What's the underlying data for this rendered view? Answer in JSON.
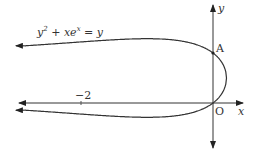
{
  "chart_data": {
    "type": "line",
    "title": "",
    "equation": "y^2 + x e^x = y",
    "xlabel": "x",
    "ylabel": "y",
    "tick_labels": [
      "-2"
    ],
    "points": [
      {
        "label": "A",
        "x": 0,
        "y": 1
      },
      {
        "label": "O",
        "x": 0,
        "y": 0
      }
    ],
    "asymptotes": [
      {
        "y": 1
      },
      {
        "y": 0
      }
    ],
    "series": [
      {
        "name": "upper branch",
        "x": [
          -3.2,
          -3,
          -2,
          -1,
          -0.5,
          0,
          0.1,
          0.204
        ],
        "y": [
          1.15,
          1.14,
          1.23,
          1.29,
          1.25,
          1.0,
          0.8,
          0.5
        ]
      },
      {
        "name": "lower branch",
        "x": [
          -3.2,
          -3,
          -2,
          -1,
          -0.5,
          0,
          0.1,
          0.204
        ],
        "y": [
          -0.15,
          -0.14,
          -0.23,
          -0.29,
          -0.25,
          0.0,
          0.2,
          0.5
        ]
      }
    ],
    "xlim": [
      -3.2,
      0.45
    ],
    "ylim": [
      -0.6,
      1.95
    ],
    "grid": false
  },
  "labels": {
    "equation_base": "y",
    "equation_sup": "2",
    "equation_mid": " + xe",
    "equation_sup2": "x",
    "equation_end": " = y",
    "y_axis": "y",
    "x_axis": "x",
    "point_a": "A",
    "origin": "O",
    "tick_minus2": "−2"
  }
}
